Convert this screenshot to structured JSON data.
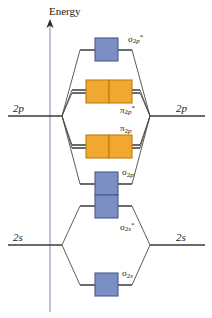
{
  "diagram": {
    "axis": {
      "label": "Energy",
      "direction": "up",
      "icon": "up-arrow-icon"
    },
    "atomic_orbitals": {
      "left": [
        {
          "name": "left-2p",
          "label": "2p",
          "y": 116
        },
        {
          "name": "left-2s",
          "label": "2s",
          "y": 245
        }
      ],
      "right": [
        {
          "name": "right-2p",
          "label": "2p",
          "y": 116
        },
        {
          "name": "right-2s",
          "label": "2s",
          "y": 245
        }
      ]
    },
    "molecular_orbitals": [
      {
        "name": "sigma-2p-star",
        "greek": "σ",
        "sub_n": "2",
        "sub_sym": "p",
        "star": "*",
        "type": "antibonding",
        "box_color": "#7b8fc4",
        "boxes": 1,
        "degenerate": false,
        "y": 50
      },
      {
        "name": "pi-2p-star",
        "greek": "π",
        "sub_n": "2",
        "sub_sym": "p",
        "star": "*",
        "type": "antibonding",
        "box_color": "#f0a830",
        "boxes": 2,
        "degenerate": true,
        "y": 91
      },
      {
        "name": "pi-2p",
        "greek": "π",
        "sub_n": "2",
        "sub_sym": "p",
        "star": "",
        "type": "bonding",
        "box_color": "#f0a830",
        "boxes": 2,
        "degenerate": true,
        "y": 146
      },
      {
        "name": "sigma-2p",
        "greek": "σ",
        "sub_n": "2",
        "sub_sym": "p",
        "star": "",
        "type": "bonding",
        "box_color": "#7b8fc4",
        "boxes": 1,
        "degenerate": false,
        "y": 184
      },
      {
        "name": "sigma-2s-star",
        "greek": "σ",
        "sub_n": "2",
        "sub_sym": "s",
        "star": "*",
        "type": "antibonding",
        "box_color": "#7b8fc4",
        "boxes": 1,
        "degenerate": false,
        "y": 206
      },
      {
        "name": "sigma-2s",
        "greek": "σ",
        "sub_n": "2",
        "sub_sym": "s",
        "star": "",
        "type": "bonding",
        "box_color": "#7b8fc4",
        "boxes": 1,
        "degenerate": false,
        "y": 285
      }
    ],
    "colors": {
      "sigma_box_fill": "#7b8fc4",
      "sigma_box_stroke": "#4a5a8c",
      "pi_box_fill": "#f0a830",
      "pi_box_stroke": "#c07a10",
      "line": "#3a3a3a",
      "axis": "#a8a8c0",
      "text": "#1a1a1a",
      "background": "#ffffff"
    }
  }
}
